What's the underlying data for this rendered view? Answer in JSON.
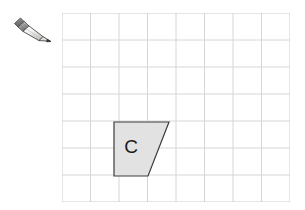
{
  "page": {
    "background_color": "#ffffff"
  },
  "toolbar": {
    "pencil": {
      "icon_name": "pencil-icon",
      "label": "Pencil",
      "body_color": "#f2f2f0",
      "outline_color": "#4d4d4d",
      "ferrule_color": "#b8b8b8",
      "tip_color": "#3a3a3a"
    }
  },
  "grid": {
    "columns": 8,
    "rows": 7,
    "cell_width": 28.5,
    "cell_height": 27,
    "origin_x": 62,
    "origin_y": 13,
    "line_color": "#d6d6d6",
    "border_color": "#cccccc",
    "line_width": 1
  },
  "shapes": [
    {
      "name": "shape-c",
      "label": "C",
      "type": "quadrilateral",
      "fill_color": "#e2e2e2",
      "stroke_color": "#3c3c3c",
      "stroke_width": 1.2,
      "points": [
        {
          "x": 114,
          "y": 122
        },
        {
          "x": 169,
          "y": 122
        },
        {
          "x": 148,
          "y": 176
        },
        {
          "x": 114,
          "y": 176
        }
      ],
      "label_position": {
        "x": 131,
        "y": 147
      },
      "label_color": "#1a1a1a",
      "label_font_size": 19
    }
  ]
}
